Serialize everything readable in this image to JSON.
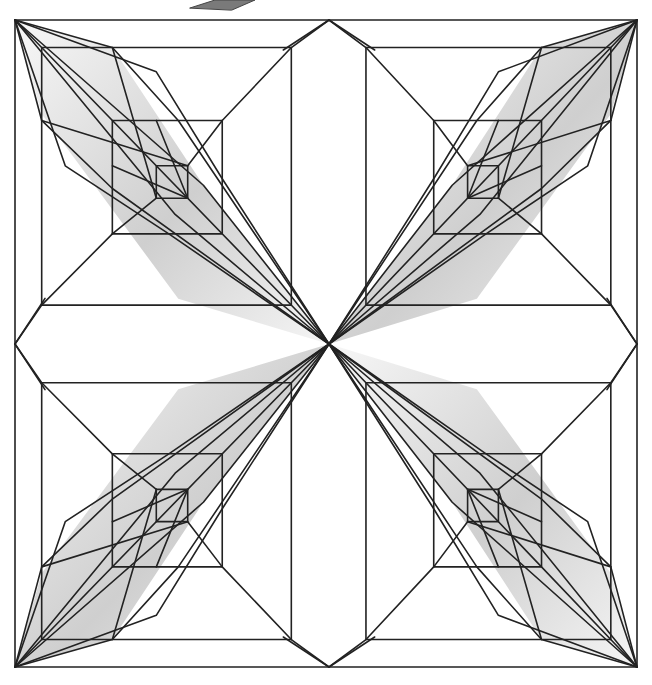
{
  "diagram": {
    "title": "",
    "type": "geometric-line-art",
    "width": 652,
    "height": 685,
    "colors": {
      "background": "#ffffff",
      "line": "#222222",
      "shade_dark": "#c8c8c8",
      "shade_light": "#f7f7f7"
    },
    "stroke_width": 1.6,
    "outer_square": {
      "x1": 15,
      "y1": 20,
      "x2": 637,
      "y2": 667
    },
    "center": {
      "x": 329,
      "y": 344
    },
    "top_ornament": {
      "points": [
        [
          190,
          8
        ],
        [
          215,
          0
        ],
        [
          255,
          0
        ],
        [
          232,
          10
        ]
      ]
    }
  }
}
